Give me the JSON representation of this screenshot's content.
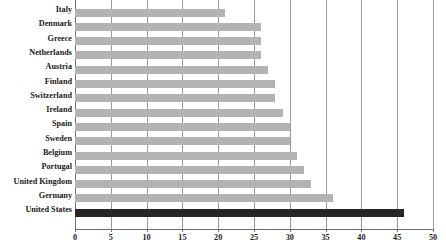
{
  "chart_data": {
    "type": "bar",
    "orientation": "horizontal",
    "title": "",
    "subtitle": "",
    "xlabel": "",
    "ylabel": "",
    "xlim": [
      0,
      50
    ],
    "xticks": [
      0,
      5,
      10,
      15,
      20,
      25,
      30,
      35,
      40,
      45,
      50
    ],
    "xtick_labels": [
      "0",
      "5",
      "10",
      "15",
      "20",
      "25",
      "30",
      "35",
      "40",
      "45",
      "50"
    ],
    "grid": true,
    "grid_axis": "x",
    "legend": false,
    "legend_position": "none",
    "categories": [
      "Italy",
      "Denmark",
      "Greece",
      "Netherlands",
      "Austria",
      "Finland",
      "Switzerland",
      "Ireland",
      "Spain",
      "Sweden",
      "Belgium",
      "Portugal",
      "United Kingdom",
      "Germany",
      "United States"
    ],
    "values": [
      21,
      26,
      26,
      26,
      27,
      28,
      28,
      29,
      30,
      30,
      31,
      32,
      33,
      36,
      46
    ],
    "highlight_category": "United States",
    "colors": {
      "bar": "#b3b3b3",
      "bar_highlight": "#262626",
      "gridline": "#9a9a9a",
      "axis": "#6e6e6e",
      "text": "#1a1a1a",
      "background": "#ffffff"
    }
  }
}
